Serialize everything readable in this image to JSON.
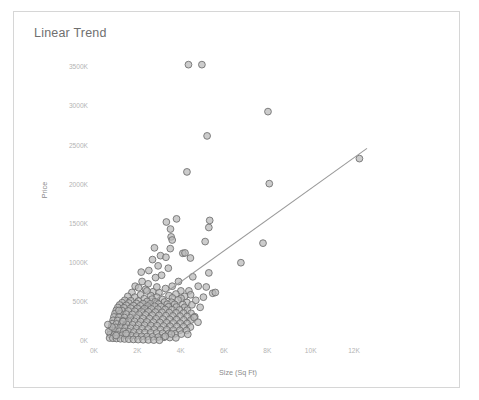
{
  "card": {
    "title": "Linear Trend"
  },
  "chart_data": {
    "type": "scatter",
    "title": "Linear Trend",
    "xlabel": "Size (Sq Ft)",
    "ylabel": "Price",
    "grid": false,
    "legend": null,
    "xlim": [
      0,
      13400
    ],
    "ylim": [
      0,
      3700
    ],
    "xticks": [
      0,
      2000,
      4000,
      6000,
      8000,
      10000,
      12000
    ],
    "xticklabels": [
      "0K",
      "2K",
      "4K",
      "6K",
      "8K",
      "10K",
      "12K"
    ],
    "yticks": [
      0,
      500,
      1000,
      1500,
      2000,
      2500,
      3000,
      3500
    ],
    "yticklabels": [
      "0K",
      "500K",
      "1000K",
      "1500K",
      "2000K",
      "2500K",
      "3000K",
      "3500K"
    ],
    "y_units": "thousands",
    "marker_color": "#b9b9b9",
    "marker_edge_color": "#6d6d6d",
    "trendline_color": "#9a9a9a",
    "trendline": {
      "x": [
        900,
        12600
      ],
      "y": [
        140,
        2460
      ]
    },
    "points": [
      [
        4360,
        3530
      ],
      [
        4980,
        3530
      ],
      [
        8030,
        2930
      ],
      [
        5220,
        2620
      ],
      [
        12250,
        2330
      ],
      [
        8090,
        2010
      ],
      [
        4290,
        2160
      ],
      [
        3810,
        1560
      ],
      [
        5340,
        1540
      ],
      [
        5300,
        1450
      ],
      [
        3530,
        1430
      ],
      [
        3560,
        1330
      ],
      [
        3610,
        1290
      ],
      [
        5130,
        1270
      ],
      [
        7800,
        1250
      ],
      [
        3520,
        1180
      ],
      [
        4100,
        1120
      ],
      [
        4200,
        1125
      ],
      [
        3070,
        1090
      ],
      [
        3320,
        1070
      ],
      [
        6780,
        1000
      ],
      [
        2700,
        1040
      ],
      [
        5300,
        870
      ],
      [
        2960,
        960
      ],
      [
        3430,
        930
      ],
      [
        2530,
        900
      ],
      [
        4560,
        820
      ],
      [
        3120,
        840
      ],
      [
        2840,
        810
      ],
      [
        4810,
        700
      ],
      [
        5180,
        690
      ],
      [
        2220,
        760
      ],
      [
        2500,
        730
      ],
      [
        3610,
        700
      ],
      [
        1900,
        700
      ],
      [
        2060,
        680
      ],
      [
        3300,
        670
      ],
      [
        2380,
        660
      ],
      [
        4010,
        640
      ],
      [
        4380,
        640
      ],
      [
        2730,
        630
      ],
      [
        3000,
        620
      ],
      [
        1750,
        620
      ],
      [
        3780,
        600
      ],
      [
        4460,
        590
      ],
      [
        2150,
        590
      ],
      [
        2620,
        580
      ],
      [
        3460,
        580
      ],
      [
        4180,
        570
      ],
      [
        1560,
        570
      ],
      [
        1880,
        560
      ],
      [
        2900,
        560
      ],
      [
        3620,
        550
      ],
      [
        4020,
        545
      ],
      [
        2320,
        540
      ],
      [
        2680,
        535
      ],
      [
        3160,
        530
      ],
      [
        3880,
        525
      ],
      [
        1420,
        520
      ],
      [
        1700,
        515
      ],
      [
        2050,
        510
      ],
      [
        2450,
        505
      ],
      [
        2820,
        500
      ],
      [
        3250,
        498
      ],
      [
        3580,
        495
      ],
      [
        4290,
        492
      ],
      [
        1300,
        490
      ],
      [
        1610,
        485
      ],
      [
        1960,
        480
      ],
      [
        2260,
        478
      ],
      [
        2600,
        475
      ],
      [
        2980,
        472
      ],
      [
        3380,
        470
      ],
      [
        3720,
        468
      ],
      [
        4100,
        465
      ],
      [
        4520,
        462
      ],
      [
        1180,
        460
      ],
      [
        1490,
        456
      ],
      [
        1820,
        452
      ],
      [
        2140,
        450
      ],
      [
        2480,
        447
      ],
      [
        2800,
        444
      ],
      [
        3090,
        440
      ],
      [
        3440,
        437
      ],
      [
        3800,
        434
      ],
      [
        4180,
        430
      ],
      [
        1100,
        428
      ],
      [
        1380,
        424
      ],
      [
        1690,
        420
      ],
      [
        2000,
        417
      ],
      [
        2330,
        414
      ],
      [
        2650,
        410
      ],
      [
        2950,
        407
      ],
      [
        3280,
        404
      ],
      [
        3600,
        400
      ],
      [
        3950,
        397
      ],
      [
        4310,
        394
      ],
      [
        1030,
        392
      ],
      [
        1290,
        388
      ],
      [
        1580,
        384
      ],
      [
        1880,
        380
      ],
      [
        2190,
        377
      ],
      [
        2510,
        374
      ],
      [
        2830,
        370
      ],
      [
        3140,
        367
      ],
      [
        3470,
        364
      ],
      [
        3790,
        360
      ],
      [
        4130,
        357
      ],
      [
        4480,
        354
      ],
      [
        970,
        350
      ],
      [
        1210,
        347
      ],
      [
        1480,
        344
      ],
      [
        1770,
        340
      ],
      [
        2070,
        337
      ],
      [
        2380,
        334
      ],
      [
        2690,
        330
      ],
      [
        3000,
        327
      ],
      [
        3320,
        324
      ],
      [
        3640,
        320
      ],
      [
        3970,
        317
      ],
      [
        4300,
        314
      ],
      [
        4650,
        310
      ],
      [
        920,
        307
      ],
      [
        1150,
        304
      ],
      [
        1400,
        300
      ],
      [
        1680,
        297
      ],
      [
        1970,
        294
      ],
      [
        2260,
        290
      ],
      [
        2560,
        287
      ],
      [
        2870,
        284
      ],
      [
        3180,
        280
      ],
      [
        3490,
        277
      ],
      [
        3810,
        274
      ],
      [
        4140,
        270
      ],
      [
        4470,
        267
      ],
      [
        880,
        264
      ],
      [
        1090,
        261
      ],
      [
        1330,
        258
      ],
      [
        1590,
        254
      ],
      [
        1870,
        251
      ],
      [
        2150,
        248
      ],
      [
        2440,
        244
      ],
      [
        2740,
        241
      ],
      [
        3040,
        238
      ],
      [
        3350,
        234
      ],
      [
        3660,
        231
      ],
      [
        3980,
        228
      ],
      [
        4300,
        224
      ],
      [
        840,
        221
      ],
      [
        1040,
        218
      ],
      [
        1270,
        215
      ],
      [
        1510,
        212
      ],
      [
        1780,
        208
      ],
      [
        2050,
        205
      ],
      [
        2330,
        202
      ],
      [
        2620,
        198
      ],
      [
        2910,
        195
      ],
      [
        3210,
        192
      ],
      [
        3510,
        188
      ],
      [
        3820,
        185
      ],
      [
        4130,
        182
      ],
      [
        4450,
        178
      ],
      [
        810,
        176
      ],
      [
        1000,
        173
      ],
      [
        1210,
        170
      ],
      [
        1440,
        167
      ],
      [
        1690,
        164
      ],
      [
        1950,
        160
      ],
      [
        2220,
        157
      ],
      [
        2500,
        154
      ],
      [
        2780,
        150
      ],
      [
        3070,
        147
      ],
      [
        3360,
        144
      ],
      [
        3660,
        140
      ],
      [
        3960,
        137
      ],
      [
        4270,
        134
      ],
      [
        780,
        131
      ],
      [
        960,
        128
      ],
      [
        1160,
        125
      ],
      [
        1370,
        122
      ],
      [
        1600,
        118
      ],
      [
        1840,
        115
      ],
      [
        2090,
        112
      ],
      [
        2350,
        108
      ],
      [
        2620,
        105
      ],
      [
        2890,
        102
      ],
      [
        3170,
        98
      ],
      [
        3450,
        95
      ],
      [
        3740,
        92
      ],
      [
        4030,
        88
      ],
      [
        4330,
        85
      ],
      [
        750,
        83
      ],
      [
        920,
        80
      ],
      [
        1100,
        77
      ],
      [
        1300,
        74
      ],
      [
        1510,
        70
      ],
      [
        1730,
        67
      ],
      [
        1960,
        64
      ],
      [
        2200,
        60
      ],
      [
        2450,
        57
      ],
      [
        2700,
        54
      ],
      [
        2960,
        50
      ],
      [
        3230,
        47
      ],
      [
        3500,
        44
      ],
      [
        3780,
        40
      ],
      [
        720,
        38
      ],
      [
        870,
        35
      ],
      [
        1040,
        32
      ],
      [
        1220,
        29
      ],
      [
        1410,
        26
      ],
      [
        1610,
        23
      ],
      [
        1820,
        20
      ],
      [
        2040,
        18
      ],
      [
        2270,
        16
      ],
      [
        2510,
        14
      ],
      [
        2760,
        12
      ],
      [
        3020,
        10
      ],
      [
        3290,
        60
      ],
      [
        3570,
        90
      ],
      [
        680,
        120
      ],
      [
        1480,
        95
      ],
      [
        2440,
        640
      ],
      [
        4700,
        520
      ],
      [
        5050,
        560
      ],
      [
        1150,
        390
      ],
      [
        2900,
        690
      ],
      [
        4620,
        300
      ],
      [
        5480,
        610
      ],
      [
        4800,
        240
      ],
      [
        1340,
        250
      ],
      [
        830,
        180
      ],
      [
        3900,
        760
      ],
      [
        4450,
        1060
      ],
      [
        2790,
        1190
      ],
      [
        3340,
        1520
      ],
      [
        5600,
        620
      ],
      [
        1020,
        70
      ],
      [
        640,
        210
      ],
      [
        2180,
        880
      ],
      [
        4900,
        430
      ]
    ]
  }
}
